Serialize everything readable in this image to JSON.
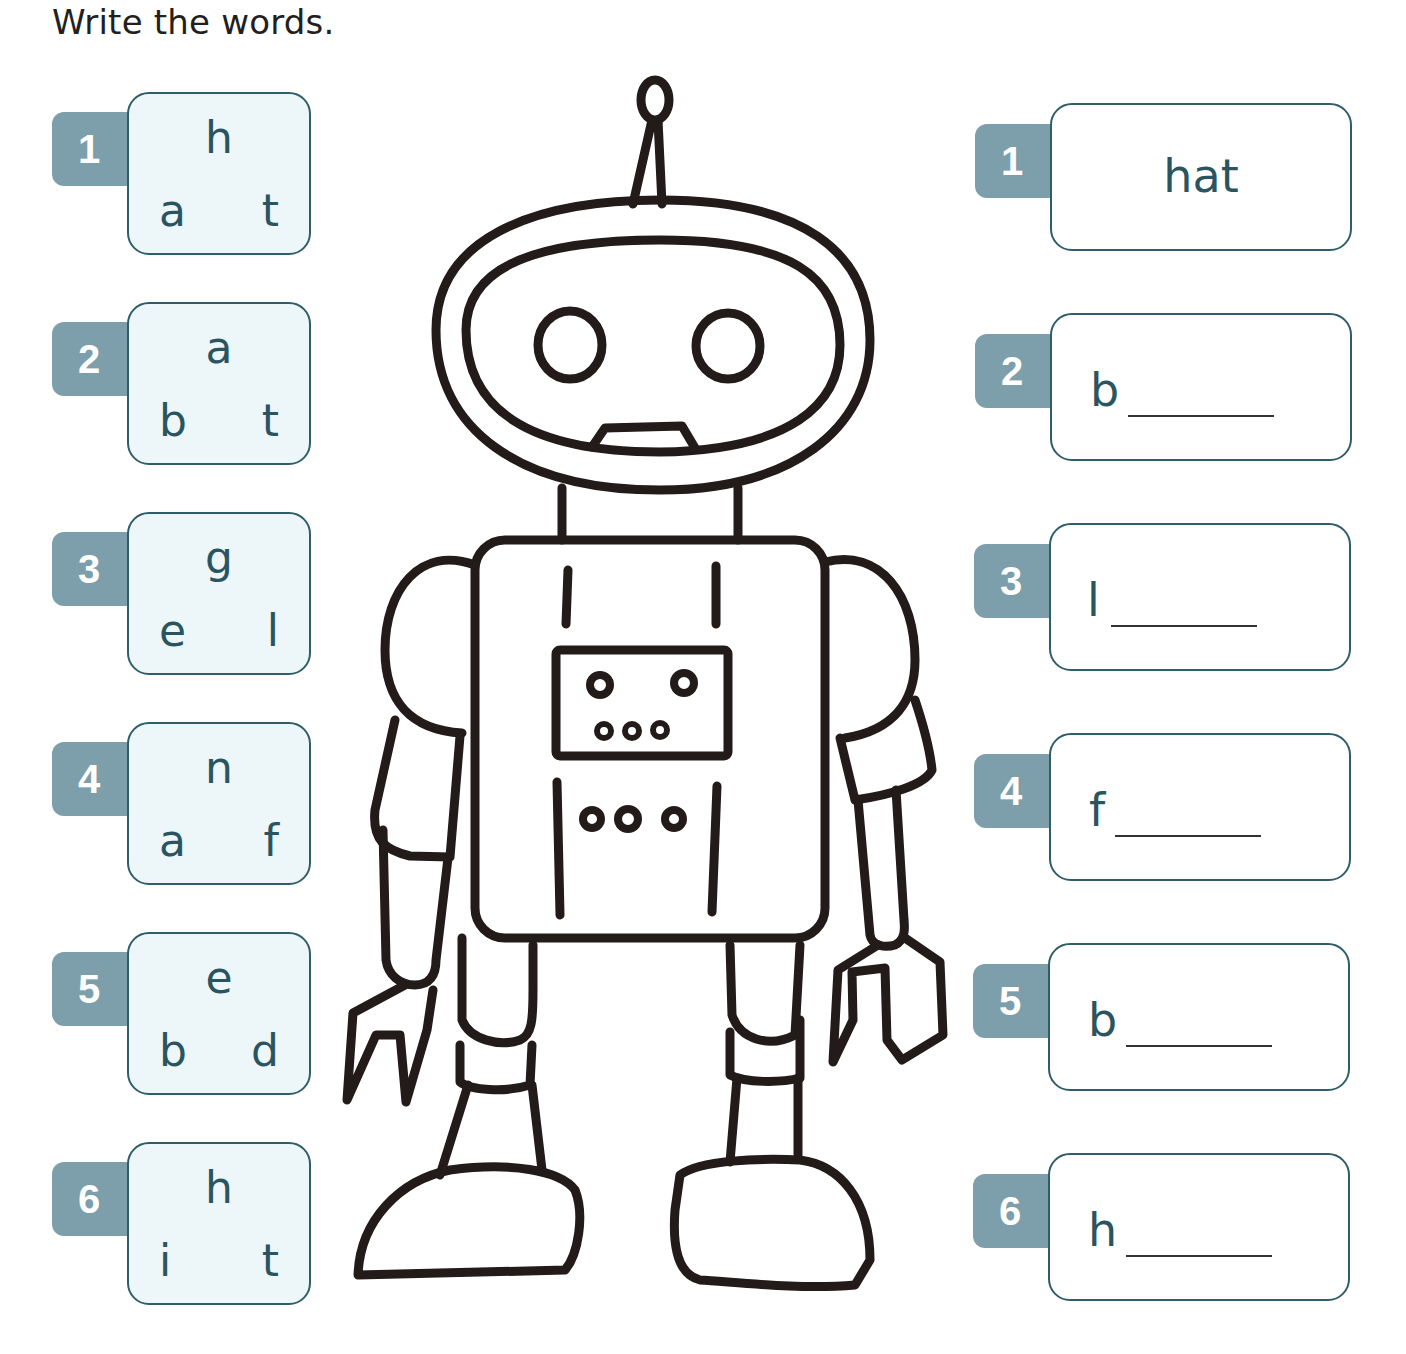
{
  "title": "Write the words.",
  "colors": {
    "badge": "#7d9fab",
    "box_border": "#2f5d68",
    "letter_box_bg": "#edf7fa",
    "letter_text": "#2a5560",
    "robot_outline": "#231a1a"
  },
  "scrambled": [
    {
      "number": "1",
      "top": "h",
      "bottom_left": "a",
      "bottom_right": "t"
    },
    {
      "number": "2",
      "top": "a",
      "bottom_left": "b",
      "bottom_right": "t"
    },
    {
      "number": "3",
      "top": "g",
      "bottom_left": "e",
      "bottom_right": "l"
    },
    {
      "number": "4",
      "top": "n",
      "bottom_left": "a",
      "bottom_right": "f"
    },
    {
      "number": "5",
      "top": "e",
      "bottom_left": "b",
      "bottom_right": "d"
    },
    {
      "number": "6",
      "top": "h",
      "bottom_left": "i",
      "bottom_right": "t"
    }
  ],
  "answers": [
    {
      "number": "1",
      "word": "hat",
      "start": "",
      "blank": false
    },
    {
      "number": "2",
      "word": "",
      "start": "b",
      "blank": true
    },
    {
      "number": "3",
      "word": "",
      "start": "l",
      "blank": true
    },
    {
      "number": "4",
      "word": "",
      "start": "f",
      "blank": true
    },
    {
      "number": "5",
      "word": "",
      "start": "b",
      "blank": true
    },
    {
      "number": "6",
      "word": "",
      "start": "h",
      "blank": true
    }
  ],
  "illustration": {
    "subject": "robot-icon"
  }
}
